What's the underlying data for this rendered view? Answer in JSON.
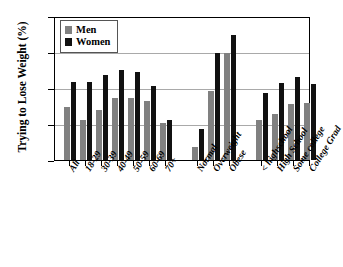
{
  "chart_data": {
    "type": "bar",
    "title": "",
    "xlabel": "",
    "ylabel": "Trying to Lose Weight (%)",
    "ylim": [
      0,
      80
    ],
    "yticks": [
      0,
      20,
      40,
      60,
      80
    ],
    "grid": true,
    "legend_position": "top-left",
    "categories": [
      "All",
      "18-29",
      "30-39",
      "40-49",
      "50-59",
      "60-69",
      "70+",
      "Normal",
      "Overweight",
      "Obese",
      "< highschool",
      "High School",
      "Some college",
      "College Grad"
    ],
    "series": [
      {
        "name": "Men",
        "color": "#808080",
        "values": [
          29,
          22,
          27.5,
          34,
          34,
          32.5,
          20.5,
          7,
          38,
          59,
          22,
          25.5,
          31,
          31.5
        ]
      },
      {
        "name": "Women",
        "color": "#111111",
        "values": [
          43,
          43,
          47,
          50,
          48.5,
          41,
          22,
          17,
          59,
          69,
          37,
          42.5,
          46,
          42
        ]
      }
    ]
  }
}
